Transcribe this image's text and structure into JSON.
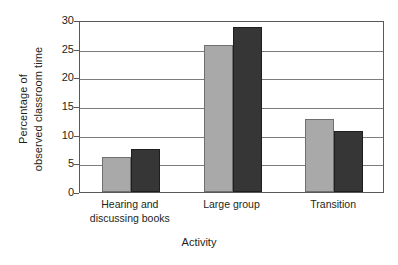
{
  "chart_data": {
    "type": "bar",
    "title": "",
    "xlabel": "Activity",
    "ylabel": "Percentage of observed classroom time",
    "ylabel_lines": [
      "Percentage of",
      "observed classroom time"
    ],
    "categories": [
      "Hearing and\ndiscussing books",
      "Large group",
      "Transition"
    ],
    "category_labels_flat": [
      "Hearing and discussing books",
      "Large group",
      "Transition"
    ],
    "series": [
      {
        "name": "Series 1",
        "color": "#a9a9a9",
        "values": [
          6.1,
          25.6,
          12.7
        ]
      },
      {
        "name": "Series 2",
        "color": "#363636",
        "values": [
          7.5,
          28.7,
          10.6
        ]
      }
    ],
    "ylim": [
      0,
      30
    ],
    "yticks": [
      0,
      5,
      10,
      15,
      20,
      25,
      30
    ],
    "ytick_labels": [
      "0",
      "5",
      "10",
      "15",
      "20",
      "25",
      "30"
    ],
    "grid": true,
    "grid_axis": "y",
    "legend": "none",
    "legend_position": "none",
    "frame": true
  },
  "colors": {
    "series_light": "#a9a9a9",
    "series_dark": "#363636",
    "axis": "#58595b",
    "gridline": "#7b7c7e",
    "text": "#231f20",
    "background": "#ffffff"
  }
}
